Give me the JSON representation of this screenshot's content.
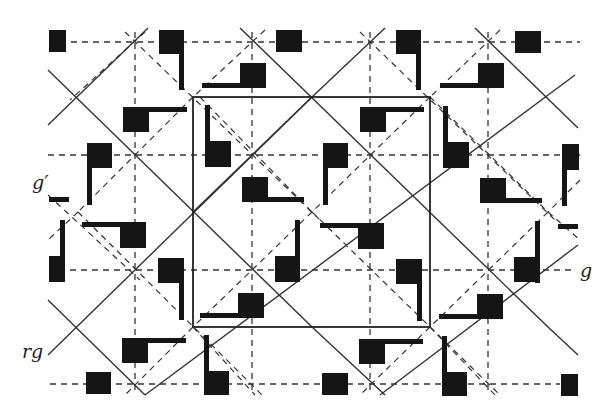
{
  "figure": {
    "type": "wallpaper-group symmetry pattern (pgg / cmm style lattice with glide reflections)",
    "labels": {
      "g_prime": "g′",
      "g": "g",
      "rg": "rg"
    },
    "colors": {
      "background": "#ffffff",
      "ink": "#1a1a1a",
      "line": "#333333"
    },
    "grid": {
      "dashed_horizontal_y": [
        42,
        155,
        270,
        384
      ],
      "dashed_vertical_x": [
        135,
        252,
        370,
        488
      ],
      "x_range": [
        48,
        580
      ],
      "y_range": [
        28,
        395
      ]
    },
    "unit_cell": {
      "x1": 193,
      "y1": 97,
      "x2": 430,
      "y2": 327
    },
    "solid_diagonals": [
      [
        48,
        125,
        140,
        30
      ],
      [
        48,
        70,
        258,
        283
      ],
      [
        48,
        125,
        258,
        340
      ],
      [
        193,
        97,
        312,
        212
      ],
      [
        140,
        30,
        430,
        327
      ],
      [
        48,
        300,
        312,
        30
      ],
      [
        48,
        355,
        140,
        265
      ],
      [
        193,
        327,
        430,
        97
      ],
      [
        312,
        212,
        430,
        327
      ],
      [
        312,
        212,
        193,
        327
      ],
      [
        242,
        30,
        548,
        327
      ],
      [
        312,
        30,
        580,
        300
      ],
      [
        430,
        97,
        580,
        245
      ],
      [
        370,
        395,
        580,
        180
      ],
      [
        470,
        395,
        580,
        290
      ],
      [
        480,
        30,
        580,
        125
      ],
      [
        312,
        395,
        580,
        125
      ],
      [
        140,
        395,
        48,
        300
      ]
    ],
    "motifs": [
      {
        "kind": "square",
        "x": 49,
        "y": 30,
        "w": 17,
        "h": 22
      },
      {
        "kind": "flag-down",
        "x": 159,
        "y": 30,
        "orient": "down-right"
      },
      {
        "kind": "square",
        "x": 276,
        "y": 30,
        "w": 26,
        "h": 22
      },
      {
        "kind": "flag-down",
        "x": 396,
        "y": 30,
        "orient": "down-right"
      },
      {
        "kind": "square",
        "x": 515,
        "y": 31,
        "w": 26,
        "h": 22
      }
    ],
    "title": ""
  }
}
